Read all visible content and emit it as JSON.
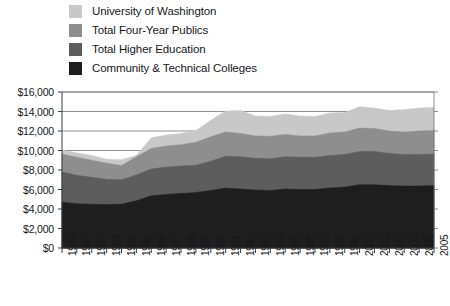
{
  "chart_data": {
    "type": "area",
    "title": "",
    "subtitle": "",
    "xlabel": "",
    "ylabel": "",
    "grid": true,
    "overlapping": true,
    "legend_position": "top-left",
    "ylim": [
      0,
      16000
    ],
    "y_ticks": [
      0,
      2000,
      4000,
      6000,
      8000,
      10000,
      12000,
      14000,
      16000
    ],
    "y_tick_labels": [
      "$0",
      "$2,000",
      "$4,000",
      "$6,000",
      "$8,000",
      "$10,000",
      "$12,000",
      "$14,000",
      "$16,000"
    ],
    "categories": [
      "1980",
      "1981",
      "1982",
      "1983",
      "1984",
      "1985",
      "1986",
      "1987",
      "1988",
      "1989",
      "1990",
      "1991",
      "1992",
      "1993",
      "1994",
      "1995",
      "1996",
      "1997",
      "1998",
      "1999",
      "2000",
      "2001",
      "2002",
      "2003",
      "2004",
      "2005"
    ],
    "series": [
      {
        "name": "University of Washington",
        "color": "#c8c8c8",
        "values": [
          10050,
          9750,
          9500,
          9100,
          9050,
          9500,
          11300,
          11600,
          11750,
          12050,
          13100,
          14050,
          14100,
          13550,
          13500,
          13750,
          13550,
          13500,
          13850,
          13900,
          14500,
          14350,
          14100,
          14200,
          14350,
          14400
        ]
      },
      {
        "name": "Total Four-Year Publics",
        "color": "#8e8e8e",
        "values": [
          9650,
          9300,
          9000,
          8700,
          8450,
          9350,
          10200,
          10450,
          10600,
          10850,
          11400,
          11900,
          11750,
          11500,
          11450,
          11650,
          11500,
          11500,
          11800,
          11900,
          12300,
          12250,
          12000,
          11900,
          12000,
          12050
        ]
      },
      {
        "name": "Total Higher Education",
        "color": "#5d5d5d",
        "values": [
          7800,
          7450,
          7250,
          7050,
          7000,
          7500,
          8100,
          8300,
          8400,
          8500,
          8900,
          9400,
          9350,
          9200,
          9150,
          9350,
          9300,
          9300,
          9500,
          9600,
          9900,
          9900,
          9700,
          9600,
          9600,
          9650
        ]
      },
      {
        "name": "Community & Technical Colleges",
        "color": "#1e1e1e",
        "values": [
          4700,
          4550,
          4500,
          4450,
          4500,
          4850,
          5350,
          5500,
          5600,
          5700,
          5900,
          6150,
          6050,
          5950,
          5900,
          6050,
          6000,
          6000,
          6150,
          6250,
          6500,
          6500,
          6400,
          6350,
          6350,
          6400
        ]
      }
    ]
  },
  "legend": {
    "items": [
      {
        "label": "University of Washington",
        "color": "#c8c8c8"
      },
      {
        "label": "Total Four-Year Publics",
        "color": "#8e8e8e"
      },
      {
        "label": "Total Higher Education",
        "color": "#5d5d5d"
      },
      {
        "label": "Community & Technical Colleges",
        "color": "#1e1e1e"
      }
    ]
  },
  "footnote": {
    "text": ""
  }
}
